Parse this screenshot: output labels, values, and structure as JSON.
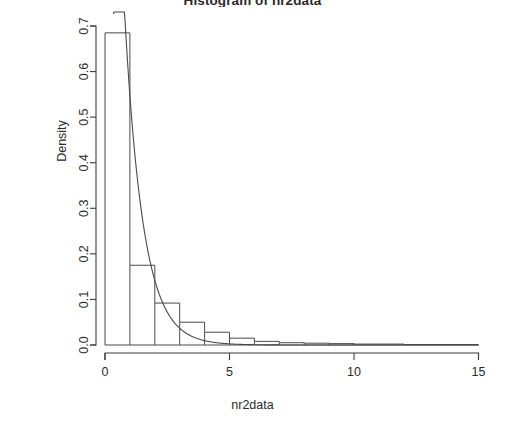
{
  "chart_data": {
    "type": "bar",
    "title": "Histogram of nr2data",
    "subtitle": "",
    "xlabel": "nr2data",
    "ylabel": "Density",
    "xlim": [
      0,
      15.2
    ],
    "ylim": [
      0,
      0.72
    ],
    "grid": false,
    "legend_position": "none",
    "xticks": [
      0,
      5,
      10,
      15
    ],
    "xtick_labels": [
      "0",
      "5",
      "10",
      "15"
    ],
    "yticks": [
      0.0,
      0.1,
      0.2,
      0.3,
      0.4,
      0.5,
      0.6,
      0.7
    ],
    "ytick_labels": [
      "0.0",
      "0.1",
      "0.2",
      "0.3",
      "0.4",
      "0.5",
      "0.6",
      "0.7"
    ],
    "bin_width": 1,
    "bin_edges": [
      0,
      1,
      2,
      3,
      4,
      5,
      6,
      7,
      8,
      9,
      10,
      11,
      12,
      13,
      14,
      15
    ],
    "categories": [
      "0-1",
      "1-2",
      "2-3",
      "3-4",
      "4-5",
      "5-6",
      "6-7",
      "7-8",
      "8-9",
      "9-10",
      "10-11",
      "11-12",
      "12-13",
      "13-14",
      "14-15"
    ],
    "values": [
      0.685,
      0.175,
      0.092,
      0.05,
      0.028,
      0.015,
      0.008,
      0.005,
      0.004,
      0.003,
      0.002,
      0.002,
      0.001,
      0.001,
      0.001
    ],
    "overlay": {
      "name": "density",
      "type": "line",
      "x_start": 0.35,
      "x_end": 15.0,
      "rate": 1.35,
      "scale": 1.06,
      "annotation": "exponential density curve clipped at plot top"
    },
    "annotations": []
  }
}
